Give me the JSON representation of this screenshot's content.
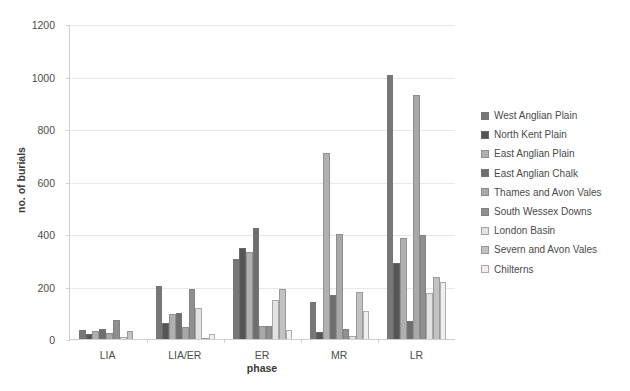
{
  "chart_data": {
    "type": "bar",
    "title": "",
    "xlabel": "phase",
    "ylabel": "no. of burials",
    "ylim": [
      0,
      1200
    ],
    "yticks": [
      0,
      200,
      400,
      600,
      800,
      1000,
      1200
    ],
    "grid": true,
    "legend_position": "right",
    "categories": [
      "LIA",
      "LIA/ER",
      "ER",
      "MR",
      "LR"
    ],
    "series": [
      {
        "name": "West Anglian Plain",
        "color": "#777777",
        "values": [
          35,
          203,
          305,
          140,
          1005
        ]
      },
      {
        "name": "North Kent Plain",
        "color": "#555555",
        "values": [
          18,
          60,
          345,
          25,
          290
        ]
      },
      {
        "name": "East Anglian Plain",
        "color": "#b0b0b0",
        "values": [
          30,
          95,
          332,
          708,
          383
        ]
      },
      {
        "name": "East Anglian Chalk",
        "color": "#6e6e6e",
        "values": [
          40,
          98,
          423,
          168,
          70
        ]
      },
      {
        "name": "Thames and Avon Vales",
        "color": "#a8a8a8",
        "values": [
          22,
          45,
          50,
          400,
          930
        ]
      },
      {
        "name": "South Wessex Downs",
        "color": "#8f8f8f",
        "values": [
          72,
          190,
          50,
          40,
          395
        ]
      },
      {
        "name": "London Basin",
        "color": "#e2e2e2",
        "values": [
          8,
          120,
          150,
          12,
          175
        ]
      },
      {
        "name": "Severn and Avon Vales",
        "color": "#c2c2c2",
        "values": [
          30,
          5,
          190,
          180,
          238
        ]
      },
      {
        "name": "Chilterns",
        "color": "#efefef",
        "values": [
          0,
          18,
          35,
          105,
          218
        ]
      }
    ]
  },
  "legend": {
    "items": [
      "West Anglian Plain",
      "North Kent Plain",
      "East Anglian Plain",
      "East Anglian Chalk",
      "Thames and Avon Vales",
      "South Wessex Downs",
      "London Basin",
      "Severn and Avon Vales",
      "Chilterns"
    ]
  }
}
